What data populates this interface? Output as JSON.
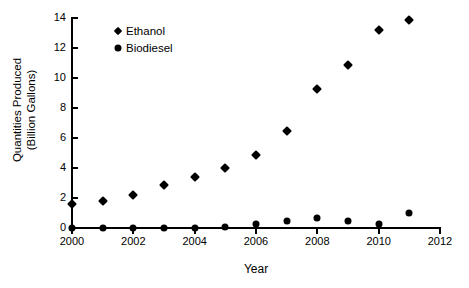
{
  "chart_data": {
    "type": "scatter",
    "title": "",
    "xlabel": "Year",
    "ylabel": "Quantities Produced\n(Billion Gallons)",
    "ylabel_line1": "Quantities Produced",
    "ylabel_line2": "(Billion Gallons)",
    "x": [
      2000,
      2001,
      2002,
      2003,
      2004,
      2005,
      2006,
      2007,
      2008,
      2009,
      2010,
      2011
    ],
    "xlim": [
      2000,
      2012
    ],
    "ylim": [
      0,
      14
    ],
    "xticks": [
      2000,
      2002,
      2004,
      2006,
      2008,
      2010,
      2012
    ],
    "xtick_labels": [
      "2000",
      "2002",
      "2004",
      "2006",
      "2008",
      "2010",
      "2012"
    ],
    "yticks": [
      0,
      2,
      4,
      6,
      8,
      10,
      12,
      14
    ],
    "ytick_labels": [
      "0",
      "2",
      "4",
      "6",
      "8",
      "10",
      "12",
      "14"
    ],
    "grid": false,
    "legend_position": "upper left inside",
    "series": [
      {
        "name": "Ethanol",
        "marker": "diamond",
        "color": "#000000",
        "values": [
          1.6,
          1.8,
          2.2,
          2.9,
          3.4,
          4.0,
          4.9,
          6.5,
          9.3,
          10.9,
          13.2,
          13.9
        ]
      },
      {
        "name": "Biodiesel",
        "marker": "circle",
        "color": "#000000",
        "values": [
          0.0,
          0.0,
          0.0,
          0.0,
          0.0,
          0.1,
          0.25,
          0.5,
          0.7,
          0.5,
          0.3,
          1.0
        ]
      }
    ]
  },
  "legend": {
    "entries": [
      {
        "label": "Ethanol",
        "marker": "diamond"
      },
      {
        "label": "Biodiesel",
        "marker": "circle"
      }
    ]
  }
}
